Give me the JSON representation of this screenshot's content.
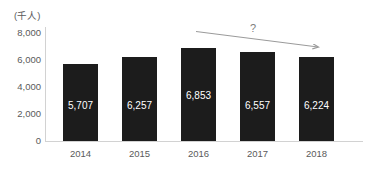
{
  "chart_data": {
    "type": "bar",
    "title": "",
    "xlabel": "",
    "ylabel": "(千人)",
    "categories": [
      "2014",
      "2015",
      "2016",
      "2017",
      "2018"
    ],
    "values": [
      5707,
      6257,
      6853,
      6557,
      6224
    ],
    "value_labels": [
      "5,707",
      "6,257",
      "6,853",
      "6,557",
      "6,224"
    ],
    "ylim": [
      0,
      8000
    ],
    "ytick_values": [
      8000,
      6000,
      4000,
      2000,
      0
    ],
    "ytick_labels": [
      "8,000",
      "6,000",
      "4,000",
      "2,000",
      "0"
    ],
    "grid": false,
    "legend": "none",
    "bar_color": "#1c1c1c",
    "value_label_color": "#ffffff",
    "axis_color": "#d2d2d2",
    "tick_label_color": "#5a5a5a",
    "annotations": [
      {
        "name": "declining-trend-arrow",
        "type": "arrow",
        "label": "?",
        "label_color": "#7d7d7d",
        "color": "#9a9a9a",
        "from_category": "2016",
        "to_category": "2018",
        "direction": "down-right"
      }
    ]
  }
}
